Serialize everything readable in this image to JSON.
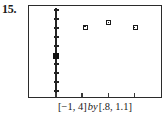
{
  "figure": {
    "number_label": "15.",
    "caption": {
      "x_window": "[−1, 4]",
      "connector": "by",
      "y_window": "[.8, 1.1]",
      "full_text": "[−1, 4] by [.8, 1.1]"
    }
  },
  "colors": {
    "frame": "#2b2b2b",
    "axis": "#232323",
    "marker_outline": "#1a1a1a",
    "marker_fill": "#ffffff",
    "marker_filled": "#111111",
    "background": "#ffffff",
    "text": "#1a1a1a"
  },
  "chart_data": {
    "type": "scatter",
    "title": "",
    "xlabel": "",
    "ylabel": "",
    "xlim": [
      -1,
      4
    ],
    "ylim": [
      0.8,
      1.1
    ],
    "grid": false,
    "legend": null,
    "axis_style": "graphing-calculator",
    "y_axis_x_value": 0,
    "points": [
      {
        "x": 0,
        "y": 0.935,
        "marker": "filled-square",
        "on_axis": true
      },
      {
        "x": 1.15,
        "y": 1.03,
        "marker": "open-square",
        "on_axis": false
      },
      {
        "x": 2.05,
        "y": 1.045,
        "marker": "open-square",
        "on_axis": false
      },
      {
        "x": 3.05,
        "y": 1.028,
        "marker": "open-square",
        "on_axis": false
      }
    ],
    "y_ticks": [
      0.82,
      0.85,
      0.88,
      0.91,
      0.94,
      0.97,
      1.0,
      1.03,
      1.06,
      1.09
    ],
    "x_ticks": [
      -1,
      0,
      1,
      2,
      3,
      4
    ],
    "x_tick_pixels": [
      30,
      85,
      110,
      135,
      158
    ],
    "y_tick_pixels": [
      14,
      26,
      38,
      50,
      62,
      74,
      86
    ]
  }
}
